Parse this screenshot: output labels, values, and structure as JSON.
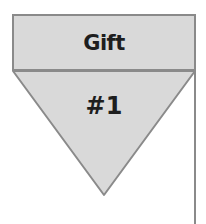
{
  "header": {
    "label": "Gift"
  },
  "marker": {
    "label": "#1"
  },
  "colors": {
    "fill": "#d9d9d9",
    "stroke": "#8a8a8a",
    "text": "#1e1e1e"
  }
}
